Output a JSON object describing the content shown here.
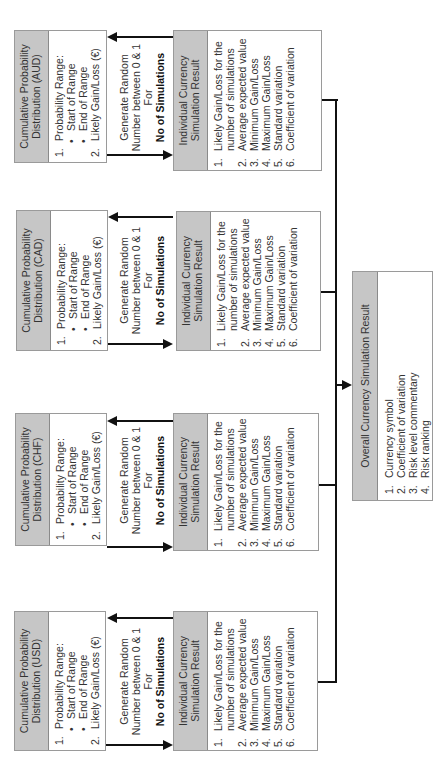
{
  "distribution_title_prefix": "Cumulative Probability",
  "distributions": [
    {
      "currency": "AUD",
      "title_line1": "Cumulative Probability",
      "title_line2": "Distribution (AUD)"
    },
    {
      "currency": "CAD",
      "title_line1": "Cumulative Probability",
      "title_line2": "Distribution (CAD)"
    },
    {
      "currency": "CHF",
      "title_line1": "Cumulative Probability",
      "title_line2": "Distribution (CHF)"
    },
    {
      "currency": "USD",
      "title_line1": "Cumulative Probability",
      "title_line2": "Distribution (USD)"
    }
  ],
  "distribution_items": {
    "item1_num": "1.",
    "item1": "Probability Range:",
    "bullet": "•",
    "sub1": "Start of Range",
    "sub2": "End of Range",
    "item2_num": "2.",
    "item2": "Likely Gain/Loss (€)"
  },
  "generator": {
    "line1": "Generate Random",
    "line2": "Number between 0 & 1",
    "line3": "For",
    "line4": "No of Simulations"
  },
  "result": {
    "title_line1": "Individual Currency",
    "title_line2": "Simulation Result",
    "items": [
      {
        "num": "1.",
        "text": "Likely Gain/Loss for the"
      },
      {
        "num": "",
        "text": "number of simulations"
      },
      {
        "num": "2.",
        "text": "Average expected value"
      },
      {
        "num": "3.",
        "text": "Minimum Gain/Loss"
      },
      {
        "num": "4.",
        "text": "Maximum Gain/Loss"
      },
      {
        "num": "5.",
        "text": "Standard variation"
      },
      {
        "num": "6.",
        "text": "Coefficient of variation"
      }
    ]
  },
  "overall": {
    "title": "Overall Currency Simulation Result",
    "items": [
      {
        "num": "1.",
        "text": "Currency symbol"
      },
      {
        "num": "2.",
        "text": "Coefficient of variation"
      },
      {
        "num": "3.",
        "text": "Risk level commentary"
      },
      {
        "num": "4.",
        "text": "Risk ranking"
      }
    ]
  },
  "colors": {
    "header_fill": "#c6c6c6",
    "border": "#9a9a9a",
    "line": "#111111"
  }
}
